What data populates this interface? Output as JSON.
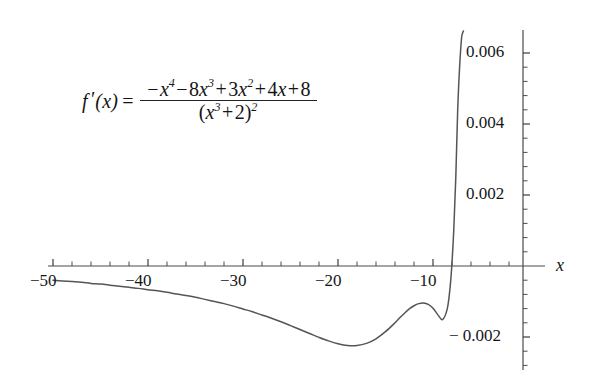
{
  "figure": {
    "background_color": "#ffffff",
    "axis_color": "#4a4a4a",
    "curve_color": "#555555",
    "text_color": "#161616"
  },
  "formula": {
    "function_name": "f",
    "prime": "′",
    "argument": "(x)",
    "equals": "=",
    "numerator": {
      "t1_sign": "−",
      "t1_base": "x",
      "t1_exp": "4",
      "t2_op": "−",
      "t2_coef": "8",
      "t2_base": "x",
      "t2_exp": "3",
      "t3_op": "+",
      "t3_coef": "3",
      "t3_base": "x",
      "t3_exp": "2",
      "t4_op": "+",
      "t4_coef": "4",
      "t4_base": "x",
      "t5_op": "+",
      "t5_const": "8",
      "plain": "−x⁴ − 8x³ + 3x² + 4x + 8"
    },
    "denominator": {
      "open": "(",
      "base": "x",
      "exp": "3",
      "op": "+",
      "const": "2",
      "close": ")",
      "outer_exp": "2",
      "plain": "(x³ + 2)²"
    },
    "plain": "f′(x) = (−x⁴ − 8x³ + 3x² + 4x + 8) / (x³ + 2)²"
  },
  "chart_data": {
    "type": "line",
    "title": "",
    "xlabel": "x",
    "ylabel": "",
    "grid": false,
    "legend": "none",
    "xlim": [
      -50.5,
      -47.6
    ],
    "ylim": [
      -0.00287,
      0.00665
    ],
    "x_axis": {
      "label": "x",
      "tick_labels": [
        "−50",
        "−40",
        "−30",
        "−20",
        "−10"
      ],
      "tick_values": [
        -50,
        -40,
        -30,
        -20,
        -10
      ],
      "minor_ticks_between": 4,
      "axis_at_y": 0
    },
    "y_axis": {
      "tick_labels": [
        "0.006",
        "0.004",
        "0.002",
        "− 0.002"
      ],
      "tick_values": [
        0.006,
        0.004,
        0.002,
        -0.002
      ],
      "minor_ticks_between": 4,
      "axis_at_x": 0,
      "labels_side": "left"
    },
    "series": [
      {
        "name": "f'(x)",
        "x": [
          -50.0,
          -49.0,
          -48.0,
          -47.0,
          -46.0,
          -45.0,
          -44.0,
          -43.0,
          -42.0,
          -41.0,
          -40.0,
          -39.0,
          -38.0,
          -37.0,
          -36.0,
          -35.0,
          -34.0,
          -33.0,
          -32.0,
          -31.0,
          -30.0,
          -29.0,
          -28.0,
          -27.0,
          -26.0,
          -25.0,
          -24.0,
          -23.0,
          -22.0,
          -21.0,
          -20.0,
          -19.0,
          -18.0,
          -17.0,
          -16.0,
          -15.0,
          -14.0,
          -13.5,
          -13.0,
          -12.5,
          -12.0,
          -11.5,
          -11.0,
          -10.5,
          -10.0,
          -9.5,
          -9.0,
          -8.5,
          -8.2,
          -8.0,
          -7.8,
          -7.6,
          -7.4,
          -7.2,
          -7.0,
          -6.9,
          -6.8,
          -6.7,
          -6.6,
          -6.5
        ],
        "y": [
          -0.0004,
          -0.00042,
          -0.00044,
          -0.00046,
          -0.00049,
          -0.00051,
          -0.00054,
          -0.00057,
          -0.0006,
          -0.00063,
          -0.00067,
          -0.0007,
          -0.00074,
          -0.00079,
          -0.00083,
          -0.00088,
          -0.00094,
          -0.001,
          -0.00106,
          -0.00113,
          -0.00121,
          -0.00129,
          -0.00138,
          -0.00147,
          -0.00157,
          -0.00168,
          -0.00179,
          -0.0019,
          -0.00201,
          -0.00211,
          -0.00219,
          -0.00224,
          -0.00224,
          -0.00218,
          -0.00205,
          -0.00185,
          -0.0016,
          -0.00146,
          -0.00133,
          -0.00121,
          -0.00112,
          -0.00106,
          -0.00104,
          -0.00108,
          -0.00119,
          -0.00137,
          -0.00151,
          -0.00121,
          -0.0006,
          0.0001,
          0.0011,
          0.0025,
          0.0044,
          0.0056,
          0.0064,
          0.00655,
          0.00662,
          0.00665,
          0.00666,
          0.00667
        ],
        "minimum_point": {
          "x": -12.0,
          "y": -0.00185
        },
        "x_intercept": {
          "x": -8.0,
          "y": 0.0
        }
      }
    ]
  }
}
